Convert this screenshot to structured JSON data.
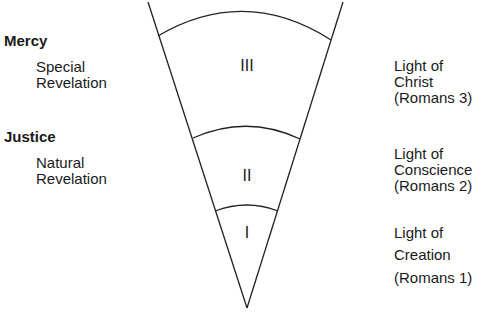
{
  "left_column": {
    "mercy": {
      "heading": "Mercy",
      "line1": "Special",
      "line2": "Revelation"
    },
    "justice": {
      "heading": "Justice",
      "line1": "Natural",
      "line2": "Revelation"
    }
  },
  "cone": {
    "sections": [
      {
        "numeral": "III"
      },
      {
        "numeral": "II"
      },
      {
        "numeral": "I"
      }
    ],
    "stroke_color": "#222222"
  },
  "right_column": {
    "items": [
      {
        "line1": "Light of",
        "line2": "Christ",
        "line3": "(Romans 3)"
      },
      {
        "line1": "Light of",
        "line2": "Conscience",
        "line3": "(Romans 2)"
      },
      {
        "line1": "Light of",
        "line2": "Creation",
        "line3": "(Romans 1)"
      }
    ]
  }
}
